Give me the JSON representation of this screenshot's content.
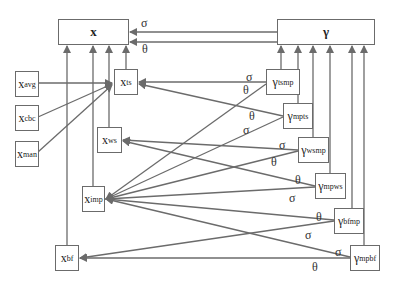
{
  "diagram": {
    "nodes": {
      "x": {
        "main": "x",
        "sub": ""
      },
      "gamma": {
        "main": "γ",
        "sub": ""
      },
      "x_avg": {
        "main": "x",
        "sub": "avg"
      },
      "x_cbc": {
        "main": "x",
        "sub": "cbc"
      },
      "x_man": {
        "main": "x",
        "sub": "man"
      },
      "x_ts": {
        "main": "x",
        "sub": "ts"
      },
      "x_ws": {
        "main": "x",
        "sub": "ws"
      },
      "x_imp": {
        "main": "x",
        "sub": "imp"
      },
      "x_bf": {
        "main": "x",
        "sub": "bf"
      },
      "g_tsmp": {
        "main": "γ",
        "sub": "tsmp"
      },
      "g_mpts": {
        "main": "γ",
        "sub": "mpts"
      },
      "g_wsmp": {
        "main": "γ",
        "sub": "wsmp"
      },
      "g_mpws": {
        "main": "γ",
        "sub": "mpws"
      },
      "g_bfmp": {
        "main": "γ",
        "sub": "bfmp"
      },
      "g_mpbf": {
        "main": "γ",
        "sub": "mpbf"
      }
    },
    "labels": {
      "top_sigma": "σ",
      "top_theta": "θ",
      "tsmp_sigma": "σ",
      "tsmp_theta": "θ",
      "mpts_theta": "θ",
      "mpts_sigma": "σ",
      "wsmp_sigma": "σ",
      "wsmp_theta": "θ",
      "mpws_theta": "θ",
      "mpws_sigma": "σ",
      "bfmp_theta": "θ",
      "bfmp_sigma": "σ",
      "mpbf_sigma": "σ",
      "mpbf_theta": "θ"
    },
    "edges": [
      {
        "from": "gamma",
        "to": "x",
        "label": "σ"
      },
      {
        "from": "gamma",
        "to": "x",
        "label": "θ"
      },
      {
        "from": "x_avg",
        "to": "x_ts"
      },
      {
        "from": "x_cbc",
        "to": "x_ts"
      },
      {
        "from": "x_man",
        "to": "x_ts"
      },
      {
        "from": "x_ts",
        "to": "x"
      },
      {
        "from": "x_ws",
        "to": "x"
      },
      {
        "from": "x_imp",
        "to": "x"
      },
      {
        "from": "x_bf",
        "to": "x"
      },
      {
        "from": "g_tsmp",
        "to": "gamma"
      },
      {
        "from": "g_mpts",
        "to": "gamma"
      },
      {
        "from": "g_wsmp",
        "to": "gamma"
      },
      {
        "from": "g_mpws",
        "to": "gamma"
      },
      {
        "from": "g_bfmp",
        "to": "gamma"
      },
      {
        "from": "g_mpbf",
        "to": "gamma"
      },
      {
        "from": "g_tsmp",
        "to": "x_ts",
        "label": "σ"
      },
      {
        "from": "g_tsmp",
        "to": "x_imp",
        "label": "θ"
      },
      {
        "from": "g_mpts",
        "to": "x_ts",
        "label": "θ"
      },
      {
        "from": "g_mpts",
        "to": "x_imp",
        "label": "σ"
      },
      {
        "from": "g_wsmp",
        "to": "x_ws",
        "label": "σ"
      },
      {
        "from": "g_wsmp",
        "to": "x_imp",
        "label": "θ"
      },
      {
        "from": "g_mpws",
        "to": "x_ws",
        "label": "θ"
      },
      {
        "from": "g_mpws",
        "to": "x_imp",
        "label": "σ"
      },
      {
        "from": "g_bfmp",
        "to": "x_imp",
        "label": "θ"
      },
      {
        "from": "g_bfmp",
        "to": "x_bf",
        "label": "σ"
      },
      {
        "from": "g_mpbf",
        "to": "x_imp",
        "label": "σ"
      },
      {
        "from": "g_mpbf",
        "to": "x_bf",
        "label": "θ"
      }
    ],
    "colors": {
      "line": "#6b6b6b",
      "box_border": "#6b6b6b",
      "text": "#222222"
    }
  }
}
